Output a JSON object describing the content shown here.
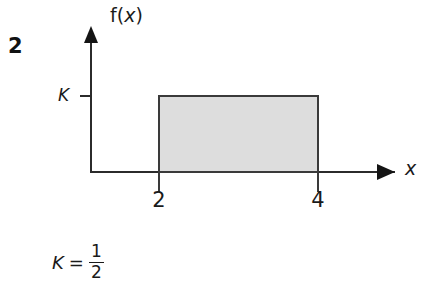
{
  "problem": {
    "number": "2"
  },
  "figure": {
    "axes": {
      "y_label": "f(x)",
      "y_label_function": "f",
      "y_label_open_paren": "(",
      "y_label_variable": "x",
      "y_label_close_paren": ")",
      "x_label": "x"
    },
    "y_tick": {
      "label": "K"
    },
    "x_ticks": [
      {
        "label": "2",
        "value": 2
      },
      {
        "label": "4",
        "value": 4
      }
    ],
    "region": {
      "name": "uniform-density-rectangle",
      "fill_color": "#dddddd",
      "border_color": "#3a3a3a",
      "height_label": "K",
      "x_start": "2",
      "x_end": "4"
    },
    "axis_color": "#2b2b2b"
  },
  "caption": {
    "symbol": "K",
    "equals": "=",
    "numerator": "1",
    "denominator": "2"
  },
  "chart_data": {
    "type": "area",
    "title": "",
    "xlabel": "x",
    "ylabel": "f(x)",
    "x": [
      2,
      4
    ],
    "values": [
      0.5,
      0.5
    ],
    "height_symbol": "K",
    "height_value": 0.5,
    "height_value_text": "1/2",
    "xlim": [
      0,
      5.2
    ],
    "ylim": [
      0,
      0.88
    ],
    "xticks": [
      2,
      4
    ],
    "xticklabels": [
      "2",
      "4"
    ],
    "yticks": [
      0.5
    ],
    "yticklabels": [
      "K"
    ],
    "grid": false,
    "legend": null,
    "annotations": [
      "K = 1/2"
    ]
  }
}
